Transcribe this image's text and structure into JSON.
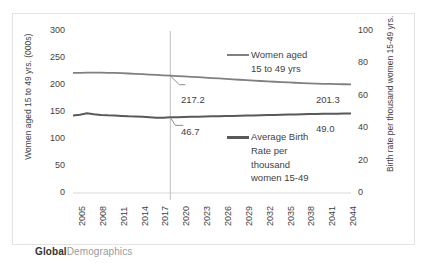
{
  "footer": {
    "brand_bold": "Global",
    "brand_light": "Demographics"
  },
  "chart_data": {
    "type": "line",
    "title": "",
    "xlabel": "",
    "ylabel": "Women aged 15 to 49 yrs. (000s)",
    "y2label": "Birth rate per thousand women 15-49 yrs.",
    "xlim": [
      2005,
      2045
    ],
    "ylim": [
      0,
      300
    ],
    "y2lim": [
      0,
      100
    ],
    "grid": false,
    "legend_position": "inside-right",
    "y_ticks": [
      300,
      250,
      200,
      150,
      100,
      50,
      0
    ],
    "y2_ticks": [
      100,
      80,
      60,
      40,
      20,
      0
    ],
    "x_ticks": [
      "2005",
      "2008",
      "2011",
      "2014",
      "2017",
      "2020",
      "2023",
      "2026",
      "2029",
      "2032",
      "2035",
      "2038",
      "2041",
      "2044"
    ],
    "x": [
      2005,
      2006,
      2007,
      2008,
      2009,
      2010,
      2011,
      2012,
      2013,
      2014,
      2015,
      2016,
      2017,
      2018,
      2019,
      2020,
      2021,
      2022,
      2023,
      2024,
      2025,
      2026,
      2027,
      2028,
      2029,
      2030,
      2031,
      2032,
      2033,
      2034,
      2035,
      2036,
      2037,
      2038,
      2039,
      2040,
      2041,
      2042,
      2043,
      2044,
      2045
    ],
    "series": [
      {
        "name": "Women aged 15 to 49 yrs",
        "axis": "left",
        "color": "#808080",
        "values": [
          222.3,
          222.6,
          222.8,
          222.9,
          222.8,
          222.6,
          222.4,
          221.9,
          221.3,
          220.7,
          220.0,
          219.3,
          218.6,
          217.9,
          217.2,
          216.6,
          215.9,
          215.2,
          214.5,
          213.7,
          212.9,
          212.1,
          211.3,
          210.5,
          209.7,
          208.9,
          208.1,
          207.4,
          206.7,
          206.0,
          205.4,
          204.8,
          204.2,
          203.6,
          203.1,
          202.6,
          202.2,
          201.9,
          201.6,
          201.4,
          201.3
        ],
        "start_label": "",
        "callout_label": "217.2",
        "end_label": "201.3"
      },
      {
        "name": "Average Birth Rate per thousand women 15-49",
        "axis": "right",
        "color": "#595959",
        "values": [
          47.8,
          48.3,
          49.2,
          48.6,
          48.2,
          48.0,
          47.9,
          47.6,
          47.3,
          47.2,
          47.0,
          46.7,
          46.4,
          46.5,
          46.7,
          46.8,
          46.9,
          47.0,
          47.1,
          47.2,
          47.3,
          47.4,
          47.5,
          47.6,
          47.7,
          47.8,
          47.9,
          48.0,
          48.1,
          48.2,
          48.3,
          48.4,
          48.5,
          48.6,
          48.7,
          48.8,
          48.85,
          48.9,
          48.95,
          49.0,
          49.0
        ],
        "callout_label": "46.7",
        "end_label": "49.0"
      }
    ],
    "annotations": [
      {
        "name": "divider-year",
        "x": 2019,
        "note": "vertical reference line separating history and forecast"
      }
    ],
    "legend": [
      {
        "label_line1": "Women aged",
        "label_line2": "15 to 49 yrs",
        "color": "#808080"
      },
      {
        "label_line1": "Average Birth",
        "label_line2": "Rate per",
        "label_line3": "thousand",
        "label_line4": "women 15-49",
        "color": "#595959"
      }
    ]
  }
}
